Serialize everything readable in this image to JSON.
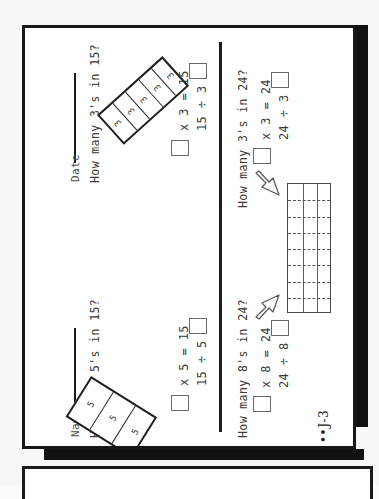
{
  "worksheet": {
    "page_code": "••J-3",
    "fields": [
      {
        "name": "name-field",
        "label": "Name"
      },
      {
        "name": "date-field",
        "label": "Date"
      }
    ],
    "problems": [
      {
        "id": "p1",
        "question": "How many 5's in 15?",
        "diagram": {
          "type": "strip",
          "segments": 3,
          "segment_label": "5"
        },
        "equations": [
          {
            "left_box": "",
            "text": "x 5 = 15"
          },
          {
            "text": "15 ÷ 5 =",
            "right_box": ""
          }
        ],
        "multiply_text": "x 5 = 15",
        "divide_text": "15 ÷ 5 ="
      },
      {
        "id": "p2",
        "question": "How many 3's in 15?",
        "diagram": {
          "type": "strip",
          "segments": 5,
          "segment_label": "3"
        },
        "multiply_text": "x 3 = 15",
        "divide_text": "15 ÷ 3 ="
      },
      {
        "id": "p3",
        "question": "How many 8's in 24?",
        "diagram": {
          "type": "grid",
          "columns": 3,
          "rows": 8
        },
        "multiply_text": "x 8 = 24",
        "divide_text": "24 ÷ 8 ="
      },
      {
        "id": "p4",
        "question": "How many 3's in 24?",
        "diagram": {
          "type": "grid",
          "columns": 3,
          "rows": 8
        },
        "multiply_text": "x 3 = 24",
        "divide_text": "24 ÷ 3 ="
      }
    ],
    "colors": {
      "page_border": "#17171a",
      "ink": "#333333",
      "shadow": "#111111",
      "paper": "#ffffff"
    }
  }
}
